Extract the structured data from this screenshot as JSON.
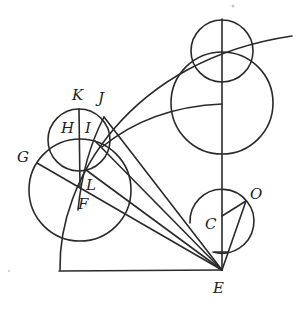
{
  "diagram": {
    "labels": {
      "K": "K",
      "J": "J",
      "H": "H",
      "I": "I",
      "G": "G",
      "L": "L",
      "F": "F",
      "C": "C",
      "O": "O",
      "E": "E"
    }
  }
}
